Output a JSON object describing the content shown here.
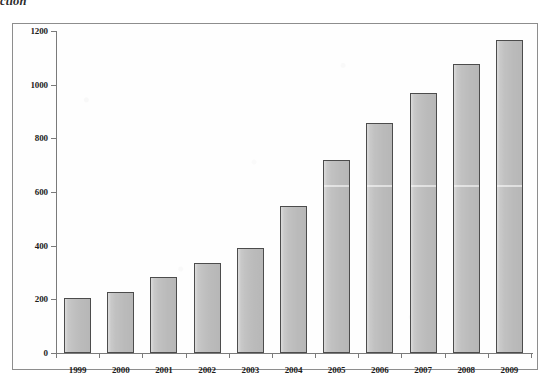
{
  "caption_fragment": "ction",
  "chart_data": {
    "type": "bar",
    "title": "",
    "xlabel": "",
    "ylabel": "",
    "categories": [
      "1999",
      "2000",
      "2001",
      "2002",
      "2003",
      "2004",
      "2005",
      "2006",
      "2007",
      "2008",
      "2009"
    ],
    "values": [
      205,
      228,
      285,
      335,
      390,
      548,
      720,
      858,
      968,
      1078,
      1168
    ],
    "series": [
      {
        "name": "",
        "values": [
          205,
          228,
          285,
          335,
          390,
          548,
          720,
          858,
          968,
          1078,
          1168
        ]
      }
    ],
    "ylim": [
      0,
      1200
    ],
    "y_ticks": [
      0,
      200,
      400,
      600,
      800,
      1000,
      1200
    ],
    "y_tick_labels": [
      "0",
      "200",
      "400",
      "600",
      "800",
      "1000",
      "1200"
    ],
    "grid": false,
    "legend": "none",
    "bar_color": "#c2c2c2",
    "bar_border_color": "#4c4c4c",
    "axis_color": "#7a7a7a",
    "frame_color": "#8d8d8d",
    "background": "#ffffff"
  }
}
